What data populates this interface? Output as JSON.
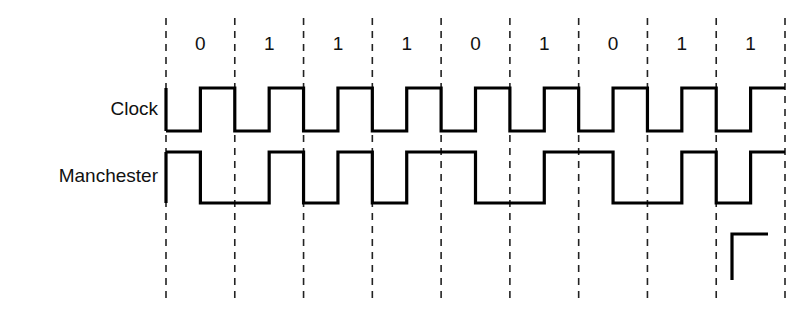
{
  "figure": {
    "background_color": "#ffffff",
    "line_color": "#000000",
    "grid_color": "#222222",
    "text_color": "#111111",
    "width": 810,
    "height": 318
  },
  "rows": {
    "clock_label": "Clock",
    "manchester_label": "Manchester"
  },
  "chart_data": {
    "type": "line",
    "xlabel": "",
    "ylabel": "",
    "grid": true,
    "legend_position": "left-labels",
    "bit_labels": [
      "0",
      "1",
      "1",
      "1",
      "0",
      "1",
      "0",
      "1",
      "1"
    ],
    "bits": [
      0,
      1,
      1,
      1,
      0,
      1,
      0,
      1,
      1
    ],
    "bit_count": 9,
    "gridline_count": 10,
    "geometry": {
      "x_start": 166,
      "x_end": 785,
      "bit_width": 68.78,
      "grid_top": 18,
      "grid_bottom": 300,
      "clock_high_y": 88,
      "clock_low_y": 131,
      "manchester_high_y": 152,
      "manchester_low_y": 203,
      "bit_label_y": 45,
      "clock_label_y": 110,
      "manchester_label_y": 177,
      "label_right_x": 158
    },
    "series": [
      {
        "name": "Clock",
        "encoding": "low first half of each bit, high second half of each bit",
        "levels_per_bit": [
          [
            0,
            1
          ],
          [
            0,
            1
          ],
          [
            0,
            1
          ],
          [
            0,
            1
          ],
          [
            0,
            1
          ],
          [
            0,
            1
          ],
          [
            0,
            1
          ],
          [
            0,
            1
          ],
          [
            0,
            1
          ]
        ]
      },
      {
        "name": "Manchester",
        "encoding": "bit 0 = high then low; bit 1 = low then high",
        "levels_per_bit": [
          [
            1,
            0
          ],
          [
            0,
            1
          ],
          [
            0,
            1
          ],
          [
            0,
            1
          ],
          [
            1,
            0
          ],
          [
            0,
            1
          ],
          [
            1,
            0
          ],
          [
            0,
            1
          ],
          [
            0,
            1
          ]
        ]
      }
    ],
    "annotation_stub": {
      "name": "rising-edge-stub",
      "x_left": 732,
      "x_right": 768,
      "y_bottom": 280,
      "y_top": 234
    }
  }
}
